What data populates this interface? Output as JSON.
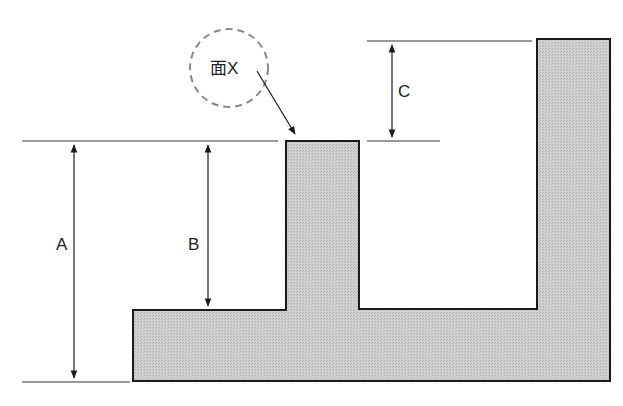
{
  "diagram": {
    "labels": {
      "a": "A",
      "b": "B",
      "c": "C",
      "face_x": "面X"
    },
    "colors": {
      "fill": "#c8c8c8",
      "stroke": "#1a1a1a",
      "dim_line": "#333333",
      "callout_circle": "#888888"
    }
  }
}
